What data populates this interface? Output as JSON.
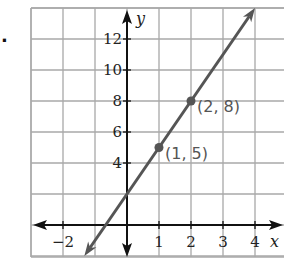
{
  "problem_marker": ".",
  "chart_data": {
    "type": "line",
    "title": "",
    "xlabel": "x",
    "ylabel": "y",
    "xlim": [
      -3,
      4.9
    ],
    "ylim": [
      -2,
      14
    ],
    "grid": true,
    "x_ticks": [
      {
        "value": -2,
        "label": "−2"
      },
      {
        "value": 1,
        "label": "1"
      },
      {
        "value": 2,
        "label": "2"
      },
      {
        "value": 3,
        "label": "3"
      },
      {
        "value": 4,
        "label": "4"
      }
    ],
    "y_ticks": [
      {
        "value": 4,
        "label": "4"
      },
      {
        "value": 6,
        "label": "6"
      },
      {
        "value": 8,
        "label": "8"
      },
      {
        "value": 10,
        "label": "10"
      },
      {
        "value": 12,
        "label": "12"
      }
    ],
    "series": [
      {
        "name": "y = 3x + 2",
        "slope": 3,
        "intercept": 2,
        "x_range": [
          -1.333,
          4
        ],
        "color": "#555555"
      }
    ],
    "points": [
      {
        "x": 1,
        "y": 5,
        "label": "(1, 5)"
      },
      {
        "x": 2,
        "y": 8,
        "label": "(2, 8)"
      }
    ]
  },
  "colors": {
    "grid": "#a8a8a8",
    "axis": "#111111",
    "line": "#555555"
  }
}
